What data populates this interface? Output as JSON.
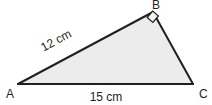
{
  "diagram": {
    "kind": "right-triangle",
    "background_color": "#ffffff",
    "fill_color": "#ececec",
    "stroke_color": "#231f20",
    "text_color": "#231f20",
    "stroke_width": 2,
    "vertices": [
      {
        "id": "A",
        "label": "A",
        "x": 18,
        "y": 84,
        "label_x": 6,
        "label_y": 93
      },
      {
        "id": "B",
        "label": "B",
        "x": 153,
        "y": 12,
        "label_x": 152,
        "label_y": 10
      },
      {
        "id": "C",
        "label": "C",
        "x": 193,
        "y": 84,
        "label_x": 198,
        "label_y": 93
      }
    ],
    "sides": [
      {
        "id": "AB",
        "from": "A",
        "to": "B",
        "label": "12 cm",
        "label_x": 58,
        "label_y": 44,
        "label_rotation": -28
      },
      {
        "id": "AC",
        "from": "A",
        "to": "C",
        "label": "15 cm",
        "label_x": 88,
        "label_y": 101,
        "label_rotation": 0
      },
      {
        "id": "BC",
        "from": "B",
        "to": "C",
        "label": "",
        "label_x": 0,
        "label_y": 0,
        "label_rotation": 0
      }
    ],
    "right_angle": {
      "at_vertex": "B",
      "marker": "square",
      "size": 11,
      "fill": "#f3f3f3",
      "stroke": "#231f20",
      "stroke_width": 1.2
    },
    "polygon_points": "18,84 153,12 193,84"
  }
}
